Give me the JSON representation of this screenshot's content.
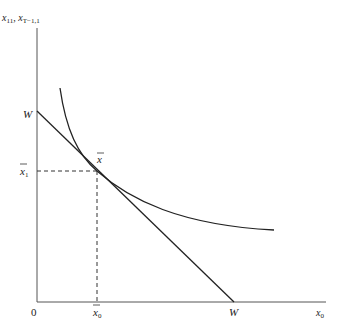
{
  "diagram": {
    "type": "economics-indifference-budget",
    "y_axis_label": "x₁₁, x_{T−1,1}",
    "y_axis_label_main": "x",
    "y_axis_label_sub1": "11",
    "y_axis_label_sep": ", x",
    "y_axis_label_sub2": "T−1,1",
    "x_axis_label_main": "x",
    "x_axis_label_sub": "0",
    "origin_label": "0",
    "budget_intercept_y_label": "W",
    "budget_intercept_x_label": "W",
    "tangency_label": "x̄",
    "tangency_label_main": "x",
    "x_star_label_main": "x",
    "x_star_label_sub": "0",
    "y_star_label_main": "x",
    "y_star_label_sub": "1",
    "colors": {
      "line": "#222222",
      "background": "#ffffff"
    }
  }
}
